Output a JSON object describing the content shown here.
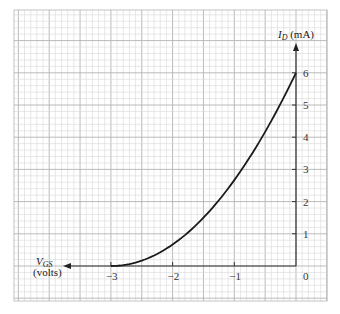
{
  "chart_data": {
    "type": "line",
    "title": "",
    "xlabel": "V_GS (volts)",
    "ylabel": "I_D (mA)",
    "x_tick_labels": [
      "−3",
      "−2",
      "−1",
      "0"
    ],
    "x_ticks": [
      -3,
      -2,
      -1,
      0
    ],
    "y_tick_labels": [
      "1",
      "2",
      "3",
      "4",
      "5",
      "6"
    ],
    "y_ticks": [
      1,
      2,
      3,
      4,
      5,
      6
    ],
    "xlim": [
      -3.8,
      0
    ],
    "ylim": [
      0,
      6.7
    ],
    "grid": true,
    "legend": null,
    "series": [
      {
        "name": "Transfer characteristic",
        "x": [
          -3.0,
          -2.75,
          -2.5,
          -2.25,
          -2.0,
          -1.75,
          -1.5,
          -1.25,
          -1.0,
          -0.75,
          -0.5,
          -0.25,
          0.0
        ],
        "values": [
          0.0,
          0.04,
          0.17,
          0.38,
          0.67,
          1.04,
          1.5,
          2.04,
          2.67,
          3.38,
          4.17,
          5.04,
          6.0
        ]
      }
    ],
    "annotations": {
      "IDSS_mA": 6,
      "VP_volts": -3
    }
  },
  "labels": {
    "y_axis_main": "I",
    "y_axis_sub": "D",
    "y_axis_unit": " (mA)",
    "x_axis_main": "V",
    "x_axis_sub": "GS",
    "x_axis_unit": "(volts)",
    "origin": "0"
  },
  "colors": {
    "background": "#ffffff",
    "grid_minor": "#d9d9d9",
    "grid_major": "#b3b3b3",
    "axis": "#333333",
    "curve": "#1a1a1a"
  }
}
